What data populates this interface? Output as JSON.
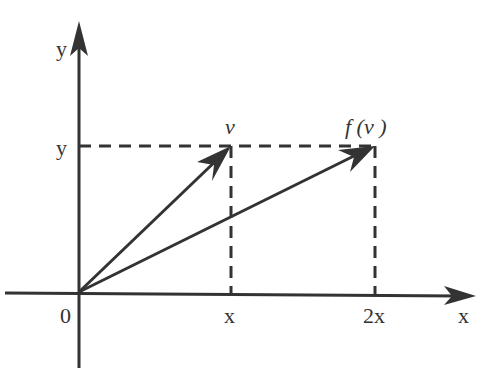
{
  "diagram": {
    "type": "vector-linear-transformation",
    "axes": {
      "x_axis_label": "x",
      "y_axis_label": "y",
      "origin_label": "0"
    },
    "ticks": {
      "x_ticks": [
        "x",
        "2x"
      ],
      "y_ticks": [
        "y"
      ]
    },
    "vectors": [
      {
        "name": "v",
        "label": "v",
        "from": [
          0,
          0
        ],
        "to": [
          "x",
          "y"
        ]
      },
      {
        "name": "f(v)",
        "label": "f (v )",
        "from": [
          0,
          0
        ],
        "to": [
          "2x",
          "y"
        ]
      }
    ],
    "guides": "dashed projection lines from vector tips to axes",
    "colors": {
      "ink": "#333333",
      "background": "#ffffff"
    }
  }
}
